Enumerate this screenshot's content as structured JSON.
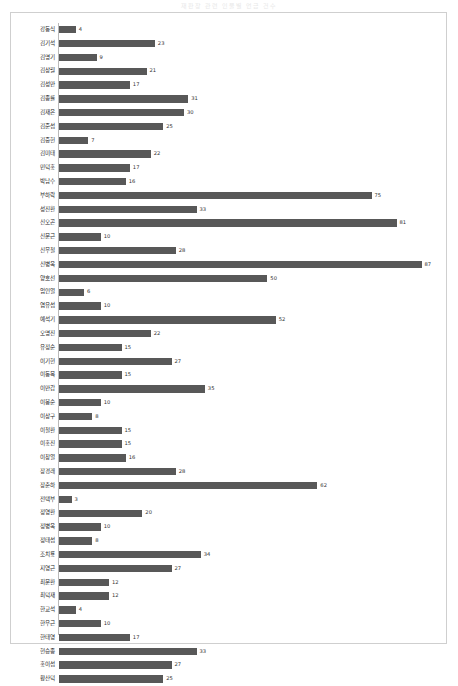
{
  "chart_data": {
    "type": "bar",
    "orientation": "horizontal",
    "title": "재판장 관련 인물별 언급 건수",
    "xlabel": "",
    "ylabel": "",
    "xlim": [
      0,
      90
    ],
    "grid": false,
    "legend": "none",
    "value_labels": true,
    "bar_color": "#585858",
    "categories": [
      "강동식",
      "김기석",
      "김명기",
      "김상월",
      "김성만",
      "김종률",
      "김재은",
      "김준섭",
      "김중헌",
      "김미태",
      "민덕홍",
      "박남수",
      "부하락",
      "성진환",
      "신오곤",
      "신문근",
      "신무철",
      "신병욱",
      "양호선",
      "엄인열",
      "염유섭",
      "예석기",
      "오명진",
      "유정순",
      "이기현",
      "이동목",
      "이만갑",
      "이봉순",
      "이상구",
      "이철환",
      "이홍진",
      "이창열",
      "장경래",
      "장춘하",
      "전택부",
      "정영환",
      "정병욱",
      "정태섭",
      "조치룡",
      "지영근",
      "최문환",
      "최덕재",
      "한교석",
      "한우근",
      "한태영",
      "현승종",
      "홍이섭",
      "황산덕"
    ],
    "values": [
      4,
      23,
      9,
      21,
      17,
      31,
      30,
      25,
      7,
      22,
      17,
      16,
      75,
      33,
      81,
      10,
      28,
      87,
      50,
      6,
      10,
      52,
      22,
      15,
      27,
      15,
      35,
      10,
      8,
      15,
      15,
      16,
      28,
      62,
      3,
      20,
      10,
      8,
      34,
      27,
      12,
      12,
      4,
      10,
      17,
      33,
      27,
      25
    ]
  }
}
